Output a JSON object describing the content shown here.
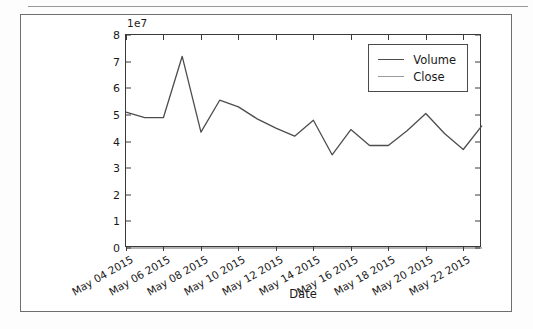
{
  "card": {
    "border_color": "#6f6f6f"
  },
  "chart_data": {
    "type": "line",
    "title": "",
    "xlabel": "Date",
    "ylabel": "",
    "y_offset_text": "1e7",
    "y_offset_multiplier": 10000000,
    "ylim": [
      0,
      80000000
    ],
    "yticks": [
      0,
      1,
      2,
      3,
      4,
      5,
      6,
      7,
      8
    ],
    "ytick_labels": [
      "0",
      "1",
      "2",
      "3",
      "4",
      "5",
      "6",
      "7",
      "8"
    ],
    "grid": false,
    "legend_position": "upper right",
    "xtick_labels": [
      "May 04 2015",
      "May 06 2015",
      "May 08 2015",
      "May 10 2015",
      "May 12 2015",
      "May 14 2015",
      "May 16 2015",
      "May 18 2015",
      "May 20 2015",
      "May 22 2015"
    ],
    "xtick_rotation_deg": -30,
    "x_index_of_ticks": [
      0,
      2,
      4,
      6,
      8,
      10,
      12,
      14,
      16,
      18
    ],
    "series": [
      {
        "name": "Volume",
        "color": "#4d4d4d",
        "values": [
          51000000,
          49000000,
          49000000,
          72000000,
          43500000,
          55500000,
          53000000,
          48500000,
          45000000,
          42000000,
          48000000,
          35000000,
          44500000,
          38500000,
          38500000,
          44000000,
          50500000,
          43000000,
          37000000,
          46000000
        ]
      },
      {
        "name": "Close",
        "color": "#9a9a9a",
        "values": [
          128,
          125,
          126,
          125,
          127,
          128,
          128,
          129,
          128,
          130,
          129,
          128,
          128,
          130,
          131,
          130,
          132,
          131,
          130,
          132
        ]
      }
    ]
  },
  "legend": {
    "entries": [
      {
        "label": "Volume",
        "color": "#4d4d4d"
      },
      {
        "label": "Close",
        "color": "#9a9a9a"
      }
    ]
  }
}
